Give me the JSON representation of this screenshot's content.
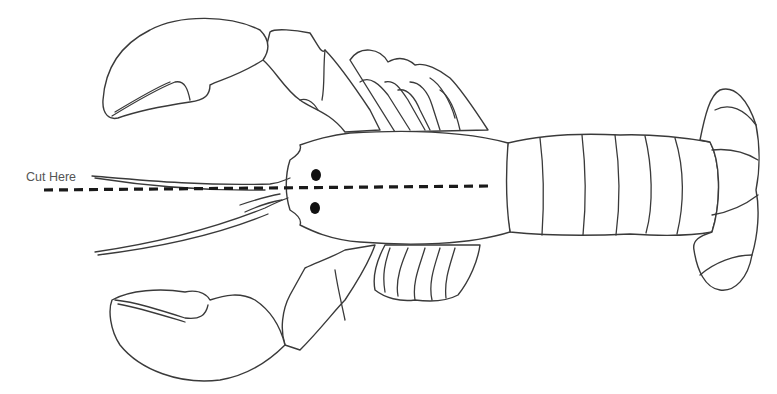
{
  "diagram": {
    "label": "Cut Here",
    "cut_line_style": "dashed",
    "colors": {
      "background": "#ffffff",
      "outline": "#3a3a3a",
      "cut_line": "#1a1a1a",
      "label_text": "#555555",
      "eyes": "#111111"
    }
  }
}
